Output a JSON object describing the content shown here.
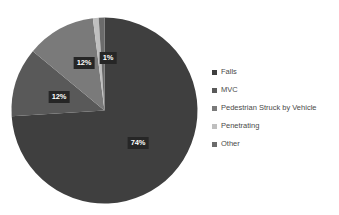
{
  "chart_data": {
    "type": "pie",
    "title": "",
    "categories": [
      "Falls",
      "MVC",
      "Pedestrian Struck by Vehicle",
      "Penetrating",
      "Other"
    ],
    "values": [
      74,
      12,
      12,
      1,
      1
    ],
    "value_labels": [
      "74%",
      "12%",
      "12%",
      "1%",
      ""
    ],
    "colors": [
      "#3f3f3f",
      "#595959",
      "#7a7a7a",
      "#bfbfbf",
      "#6b6b6b"
    ],
    "legend_position": "right",
    "start_angle_deg": 0,
    "direction": "clockwise",
    "grid": false,
    "xlabel": "",
    "ylabel": ""
  },
  "legend": {
    "items": [
      {
        "label": "Falls",
        "color": "#3f3f3f"
      },
      {
        "label": "MVC",
        "color": "#595959"
      },
      {
        "label": "Pedestrian Struck by Vehicle",
        "color": "#7a7a7a"
      },
      {
        "label": "Penetrating",
        "color": "#bfbfbf"
      },
      {
        "label": "Other",
        "color": "#6b6b6b"
      }
    ]
  },
  "slice_labels": [
    {
      "text": "74%",
      "x": 138,
      "y": 143
    },
    {
      "text": "12%",
      "x": 59,
      "y": 97
    },
    {
      "text": "12%",
      "x": 84,
      "y": 63
    },
    {
      "text": "1%",
      "x": 108,
      "y": 58
    }
  ]
}
